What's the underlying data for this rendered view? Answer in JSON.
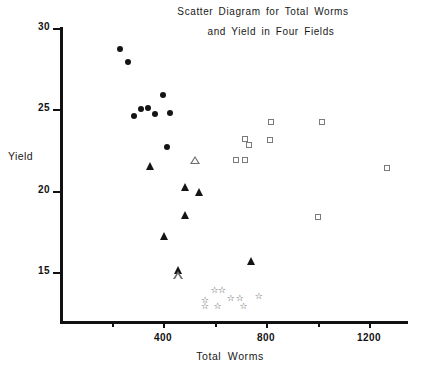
{
  "chart_data": {
    "type": "scatter",
    "title": "Scatter Diagram for Total Worms and Yield in Four Fields",
    "title_line1": "Scatter Diagram for Total Worms",
    "title_line2": "and Yield in Four Fields",
    "xlabel": "Total Worms",
    "ylabel": "Yield",
    "xlim": [
      0,
      1350
    ],
    "ylim": [
      12.5,
      30.5
    ],
    "grid": false,
    "legend": "none",
    "x_major_ticks": [
      400,
      800,
      1200
    ],
    "x_major_tick_labels": [
      "400",
      "800",
      "1200"
    ],
    "x_minor_ticks": [
      200,
      600,
      1000
    ],
    "y_ticks": [
      30,
      25,
      20,
      15
    ],
    "y_tick_labels": [
      "30",
      "25",
      "20",
      "15"
    ],
    "series": [
      {
        "name": "Field 1",
        "marker": "filled-circle",
        "points": [
          [
            232,
            28.7
          ],
          [
            263,
            27.9
          ],
          [
            399,
            25.9
          ],
          [
            314,
            25.0
          ],
          [
            341,
            25.1
          ],
          [
            287,
            24.6
          ],
          [
            368,
            24.7
          ],
          [
            426,
            24.8
          ],
          [
            414,
            22.7
          ]
        ]
      },
      {
        "name": "Field 2",
        "marker": "filled-triangle",
        "points": [
          [
            348,
            21.5
          ],
          [
            485,
            20.2
          ],
          [
            540,
            19.9
          ],
          [
            485,
            18.5
          ],
          [
            403,
            17.2
          ],
          [
            457,
            15.1
          ],
          [
            740,
            15.7
          ]
        ]
      },
      {
        "name": "Field 2 open",
        "marker": "open-triangle",
        "points": [
          [
            523,
            21.9
          ],
          [
            457,
            15.3
          ]
        ]
      },
      {
        "name": "Field 3",
        "marker": "open-square",
        "points": [
          [
            818,
            24.2
          ],
          [
            1018,
            24.2
          ],
          [
            718,
            23.2
          ],
          [
            815,
            23.1
          ],
          [
            733,
            22.8
          ],
          [
            685,
            21.9
          ],
          [
            718,
            21.9
          ],
          [
            1268,
            21.4
          ],
          [
            1000,
            18.4
          ]
        ]
      },
      {
        "name": "Field 4",
        "marker": "open-star",
        "points": [
          [
            600,
            13.9
          ],
          [
            629,
            13.9
          ],
          [
            563,
            13.3
          ],
          [
            663,
            13.4
          ],
          [
            698,
            13.4
          ],
          [
            772,
            13.5
          ],
          [
            563,
            12.9
          ],
          [
            612,
            12.9
          ],
          [
            713,
            12.9
          ]
        ]
      }
    ]
  },
  "axes_pixel_calibration": {
    "x_origin_px": 60,
    "x_scale_px_per_unit": 0.2575,
    "y_value_30_px": 28,
    "y_px_per_unit": 16.27
  }
}
